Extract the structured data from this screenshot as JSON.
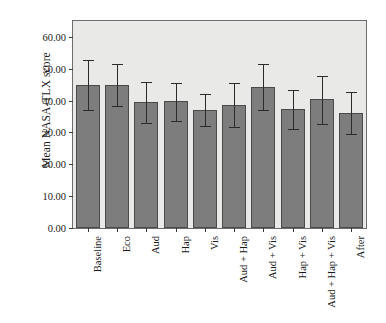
{
  "chart_data": {
    "type": "bar",
    "title": "",
    "xlabel": "",
    "ylabel": "Mean NASA-TLX score",
    "ylim": [
      0.0,
      65.0
    ],
    "yticks": [
      0.0,
      10.0,
      20.0,
      30.0,
      40.0,
      50.0,
      60.0
    ],
    "ytick_labels": [
      "0.00",
      "10.00",
      "20.00",
      "30.00",
      "40.00",
      "50.00",
      "60.00"
    ],
    "grid": false,
    "legend": "none",
    "categories": [
      "Baseline",
      "Eco",
      "Aud",
      "Hap",
      "Vis",
      "Aud + Hap",
      "Aud + Vis",
      "Hap + Vis",
      "Aud + Hap + Vis",
      "After"
    ],
    "values": [
      45.0,
      44.9,
      39.7,
      39.9,
      37.1,
      38.7,
      44.4,
      37.3,
      40.4,
      36.0
    ],
    "error_upper": [
      52.7,
      51.6,
      46.0,
      45.6,
      42.0,
      45.4,
      51.4,
      43.4,
      47.8,
      42.7
    ],
    "error_lower": [
      37.1,
      38.2,
      33.1,
      33.6,
      31.9,
      31.6,
      37.0,
      31.1,
      32.8,
      29.4
    ],
    "bar_color": "#7d7d7d",
    "bar_edge_color": "#4a4a4a",
    "error_color": "#2b2b2b",
    "plot_background": "#e9e9e7",
    "figure_background": "#ffffff",
    "axis_color": "#6d6d6d"
  }
}
